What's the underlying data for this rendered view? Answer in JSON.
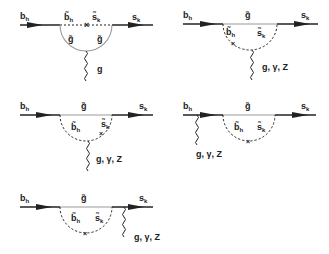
{
  "figure": {
    "colors": {
      "line": "#222222",
      "gluino": "#9a9a9a",
      "background": "#ffffff"
    },
    "diagrams": [
      {
        "id": 1,
        "external_in": "b_h",
        "external_out": "s_k",
        "loop_top_left": "b̃_h",
        "loop_top_right": "s̃_k",
        "loop_bottom_left": "g̃",
        "loop_bottom_right": "g̃",
        "emitted": "g",
        "mass_insertion": "×"
      },
      {
        "id": 2,
        "external_in": "b_h",
        "external_out": "s_k",
        "loop_top": "g̃",
        "loop_left": "b̃_h",
        "loop_right": "s̃_k",
        "emitted": "g, γ, Z",
        "mass_insertion": "×"
      },
      {
        "id": 3,
        "external_in": "b_h",
        "external_out": "s_k",
        "loop_top": "g̃",
        "loop_left": "b̃_h",
        "loop_right": "s̃_k",
        "emitted": "g, γ, Z",
        "mass_insertion": "×"
      },
      {
        "id": 4,
        "external_in": "b_h",
        "external_out": "s_k",
        "loop_top": "g̃",
        "loop_left": "b̃_h",
        "loop_right": "s̃_k",
        "emitted": "g, γ, Z",
        "mass_insertion": "×"
      },
      {
        "id": 5,
        "external_in": "b_h",
        "external_out": "s_k",
        "loop_top": "g̃",
        "loop_left": "b̃_h",
        "loop_right": "s̃_k",
        "emitted": "g, γ, Z",
        "mass_insertion": "×"
      }
    ]
  },
  "labels": {
    "b": "b",
    "h": "h",
    "s": "s",
    "k": "k",
    "btilde": "b̃",
    "stilde": "s̃",
    "gtilde": "g̃",
    "g": "g",
    "gyz": "g, γ, Z",
    "cross": "×"
  }
}
